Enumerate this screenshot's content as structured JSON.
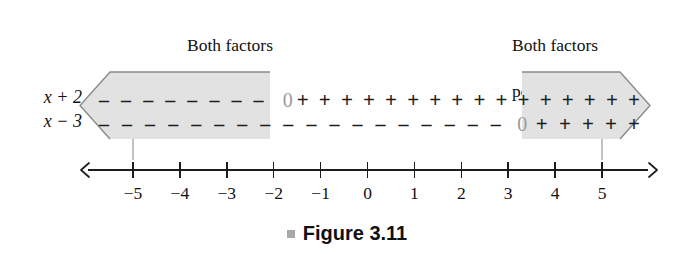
{
  "figure": {
    "caption": "Figure 3.11",
    "bullet_icon": "square-bullet-icon",
    "bullet_color": "#a8a8a8"
  },
  "callouts": [
    {
      "id": "both-factors-negative",
      "text": "Both factors\nnegative",
      "line1": "Both factors",
      "line2": "negative",
      "align": "center"
    },
    {
      "id": "both-factors-positive",
      "text": "Both factors\npositive",
      "line1": "Both factors",
      "line2": "positive",
      "align": "left"
    }
  ],
  "rows": [
    {
      "label": "x + 2",
      "zero_at": -2,
      "signs": [
        "-",
        "-",
        "-",
        "-",
        "-",
        "-",
        "-",
        "-",
        "0",
        "+",
        "+",
        "+",
        "+",
        "+",
        "+",
        "+",
        "+",
        "+",
        "+",
        "+",
        "+",
        "+",
        "+",
        "+",
        "+"
      ]
    },
    {
      "label": "x − 3",
      "zero_at": 3,
      "signs": [
        "-",
        "-",
        "-",
        "-",
        "-",
        "-",
        "-",
        "-",
        "-",
        "-",
        "-",
        "-",
        "-",
        "-",
        "-",
        "-",
        "-",
        "-",
        "0",
        "+",
        "+",
        "+",
        "+",
        "+"
      ]
    }
  ],
  "number_line": {
    "min": -5,
    "max": 5,
    "tick_labels": [
      "−5",
      "−4",
      "−3",
      "−2",
      "−1",
      "0",
      "1",
      "2",
      "3",
      "4",
      "5"
    ],
    "tick_values": [
      -5,
      -4,
      -3,
      -2,
      -1,
      0,
      1,
      2,
      3,
      4,
      5
    ],
    "left_arrow": "left-arrow-icon",
    "right_arrow": "right-arrow-icon"
  },
  "bands": [
    {
      "id": "negative-band",
      "direction": "left",
      "fill": "#e2e2e2",
      "edge": "#7d7d7d",
      "from": "-infinity",
      "to": -2
    },
    {
      "id": "positive-band",
      "direction": "right",
      "fill": "#e2e2e2",
      "edge": "#7d7d7d",
      "from": 3,
      "to": "+infinity"
    }
  ],
  "chart_data": {
    "type": "table",
    "title": "Figure 3.11",
    "xlabel": "",
    "ylabel": "",
    "xlim": [
      -5,
      5
    ],
    "grid": false,
    "categories": [
      "x + 2",
      "x − 3"
    ],
    "annotations": [
      "Both factors negative",
      "Both factors positive"
    ],
    "series": [
      {
        "name": "x + 2",
        "sign_intervals": [
          {
            "interval": "(-infinity, -2)",
            "sign": "-"
          },
          {
            "interval": "x = -2",
            "sign": "0"
          },
          {
            "interval": "(-2, +infinity)",
            "sign": "+"
          }
        ]
      },
      {
        "name": "x − 3",
        "sign_intervals": [
          {
            "interval": "(-infinity, 3)",
            "sign": "-"
          },
          {
            "interval": "x = 3",
            "sign": "0"
          },
          {
            "interval": "(3, +infinity)",
            "sign": "+"
          }
        ]
      }
    ],
    "shaded_regions": [
      {
        "label": "Both factors negative",
        "interval": "(-infinity, -2)"
      },
      {
        "label": "Both factors positive",
        "interval": "(3, +infinity)"
      }
    ]
  }
}
